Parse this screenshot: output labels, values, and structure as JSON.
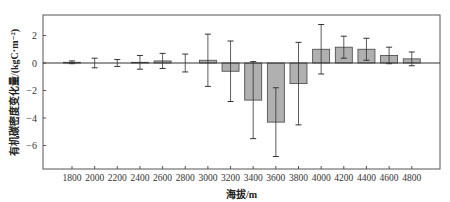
{
  "chart_data": {
    "type": "bar",
    "title": "",
    "xlabel": "海拔/m",
    "ylabel": "有机碳密度变化量/(kgC·m⁻²)",
    "categories": [
      "1800",
      "2000",
      "2200",
      "2400",
      "2600",
      "2800",
      "3000",
      "3200",
      "3400",
      "3600",
      "3800",
      "4000",
      "4200",
      "4400",
      "4600",
      "4800"
    ],
    "series": [
      {
        "name": "有机碳密度变化量",
        "values": [
          0.05,
          0.0,
          0.0,
          0.05,
          0.15,
          0.0,
          0.2,
          -0.6,
          -2.7,
          -4.3,
          -1.5,
          1.0,
          1.15,
          1.0,
          0.55,
          0.3
        ],
        "error": [
          0.1,
          0.35,
          0.25,
          0.5,
          0.55,
          0.65,
          1.9,
          2.2,
          2.8,
          2.5,
          3.0,
          1.8,
          0.8,
          0.8,
          0.6,
          0.5
        ]
      }
    ],
    "yticks": [
      2,
      0,
      -2,
      -4,
      -6
    ],
    "ylim": [
      -7.4,
      3.5
    ],
    "grid": false,
    "legend": "none",
    "bar_color": "#b0b0b0",
    "bar_edge_color": "#444444",
    "zero_line": true
  },
  "labels": {
    "xlabel": "海拔/m",
    "ylabel": "有机碳密度变化量/(kgC·m⁻²)"
  }
}
